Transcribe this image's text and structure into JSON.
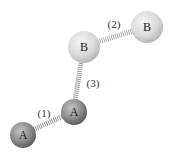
{
  "diagram": {
    "atoms": [
      {
        "id": "a1",
        "label": "A",
        "type": "A"
      },
      {
        "id": "a2",
        "label": "A",
        "type": "A"
      },
      {
        "id": "b1",
        "label": "B",
        "type": "B"
      },
      {
        "id": "b2",
        "label": "B",
        "type": "B"
      }
    ],
    "bonds": [
      {
        "label": "(1)",
        "from": "a1",
        "to": "a2"
      },
      {
        "label": "(2)",
        "from": "b1",
        "to": "b2"
      },
      {
        "label": "(3)",
        "from": "a2",
        "to": "b1"
      }
    ],
    "colors": {
      "atom_A": "#8a8a8a",
      "atom_B": "#d8d8d8",
      "spring": "#9a9a9a"
    }
  }
}
